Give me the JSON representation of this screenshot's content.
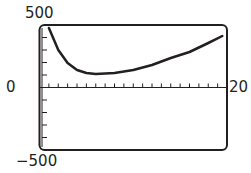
{
  "chart_data": {
    "type": "line",
    "title": "",
    "xlabel": "",
    "ylabel": "",
    "xlim": [
      0,
      20
    ],
    "ylim": [
      -500,
      500
    ],
    "grid": false,
    "legend": null,
    "x_tick_spacing": 1,
    "y_tick_spacing": 100,
    "tick_labels": {
      "y_max": "500",
      "y_zero": "0",
      "x_max": "20",
      "y_min": "−500"
    },
    "series": [
      {
        "name": "curve",
        "x": [
          1,
          2,
          3,
          4,
          5,
          6,
          8,
          10,
          12,
          14,
          16,
          18,
          19.5
        ],
        "values": [
          476,
          300,
          196,
          140,
          116,
          108,
          116,
          140,
          180,
          236,
          284,
          356,
          412
        ]
      }
    ]
  },
  "colors": {
    "ink": "#231f20",
    "background": "#ffffff"
  }
}
